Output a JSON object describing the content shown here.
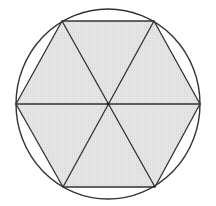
{
  "diagram": {
    "colors": {
      "background": "#ffffff",
      "hexagon_fill": "#e3e3e3",
      "stroke": "#333333"
    },
    "circle": {
      "cx": 108,
      "cy": 104,
      "rx": 92,
      "ry": 95
    },
    "center": {
      "x": 108,
      "y": 104
    },
    "vertices": [
      {
        "name": "top-left",
        "x": 62,
        "y": 21
      },
      {
        "name": "top-right",
        "x": 154,
        "y": 21
      },
      {
        "name": "right",
        "x": 200,
        "y": 104
      },
      {
        "name": "bottom-right",
        "x": 155,
        "y": 187
      },
      {
        "name": "bottom-left",
        "x": 63,
        "y": 187
      },
      {
        "name": "left",
        "x": 16,
        "y": 104
      }
    ],
    "diagonals": [
      {
        "from": "top-left",
        "to": "bottom-right"
      },
      {
        "from": "top-right",
        "to": "bottom-left"
      },
      {
        "from": "left",
        "to": "right"
      }
    ],
    "triangle_count": 6
  }
}
